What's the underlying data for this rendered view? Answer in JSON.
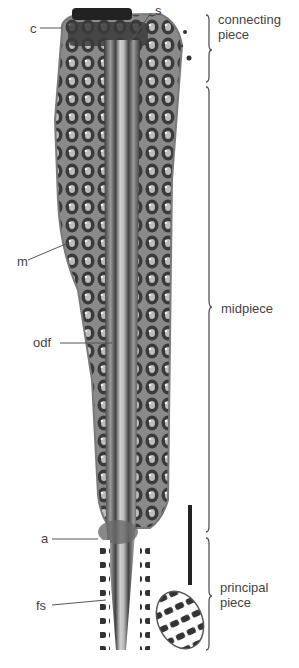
{
  "figure": {
    "type": "electron micrograph (longitudinal section of sperm tail)",
    "structure_labels": [
      {
        "id": "c",
        "text": "c",
        "x": 30,
        "y": 22
      },
      {
        "id": "s",
        "text": "s",
        "x": 157,
        "y": 4
      },
      {
        "id": "m",
        "text": "m",
        "x": 17,
        "y": 255
      },
      {
        "id": "odf",
        "text": "odf",
        "x": 33,
        "y": 336
      },
      {
        "id": "a",
        "text": "a",
        "x": 41,
        "y": 533
      },
      {
        "id": "fs",
        "text": "fs",
        "x": 36,
        "y": 599
      }
    ],
    "region_labels": [
      {
        "id": "connecting-piece",
        "line1": "connecting",
        "line2": "piece",
        "x": 218,
        "y": 10
      },
      {
        "id": "midpiece",
        "line1": "midpiece",
        "line2": "",
        "x": 221,
        "y": 302
      },
      {
        "id": "principal-piece",
        "line1": "principal",
        "line2": "piece",
        "x": 220,
        "y": 580
      }
    ],
    "scale_bar": {
      "visible": true,
      "label": ""
    }
  },
  "colors": {
    "background": "#ffffff",
    "tissue_dark": "#2a2a2a",
    "tissue_mid": "#6a6a6a",
    "tissue_light": "#a8a8a8",
    "text": "#444444",
    "leader": "#555555"
  }
}
